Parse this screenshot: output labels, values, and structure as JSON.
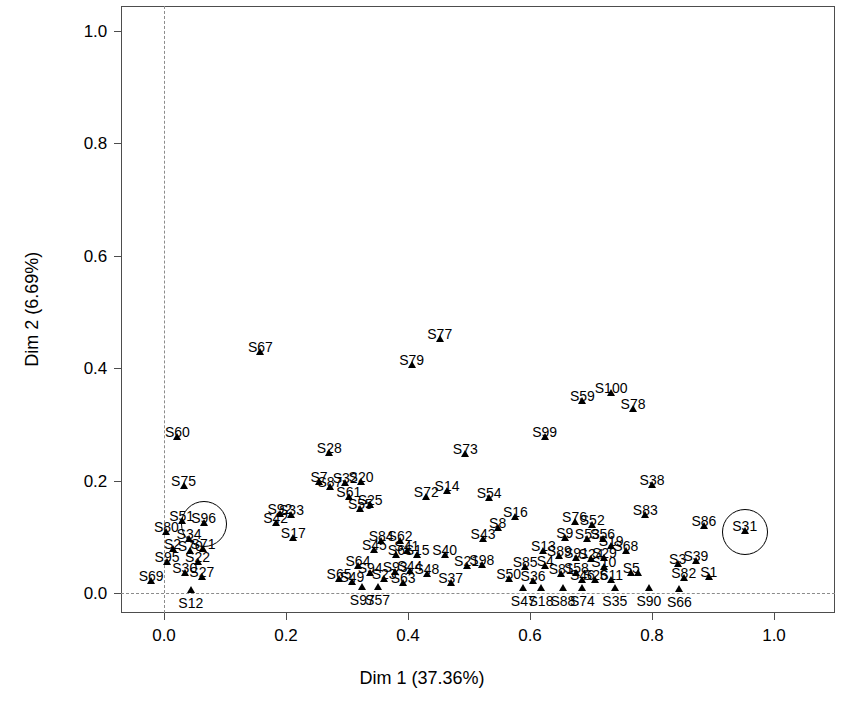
{
  "chart_data": {
    "type": "scatter",
    "title": "",
    "xlabel": "Dim 1 (37.36%)",
    "ylabel": "Dim 2 (6.69%)",
    "xlim": [
      -0.07,
      1.1
    ],
    "ylim": [
      -0.035,
      1.045
    ],
    "xticks": [
      "0.0",
      "0.2",
      "0.4",
      "0.6",
      "0.8",
      "1.0"
    ],
    "xtickvalues": [
      0.0,
      0.2,
      0.4,
      0.6,
      0.8,
      1.0
    ],
    "yticks": [
      "0.0",
      "0.2",
      "0.4",
      "0.6",
      "0.8",
      "1.0"
    ],
    "ytickvalues": [
      0.0,
      0.2,
      0.4,
      0.6,
      0.8,
      1.0
    ],
    "grid": false,
    "legend": "none",
    "marker": "filled-triangle",
    "marker_color": "#000000",
    "reference_lines": [
      {
        "orientation": "vertical",
        "value": 0.0,
        "style": "dashed",
        "color": "#8c8c8c"
      },
      {
        "orientation": "horizontal",
        "value": 0.0,
        "style": "dashed",
        "color": "#8c8c8c"
      }
    ],
    "highlighted": [
      "S96",
      "S31"
    ],
    "points": [
      {
        "label": "S67",
        "x": 0.158,
        "y": 0.423,
        "lx": -0.5,
        "ly": -15
      },
      {
        "label": "S77",
        "x": 0.452,
        "y": 0.447,
        "lx": -0.5,
        "ly": -15
      },
      {
        "label": "S79",
        "x": 0.406,
        "y": 0.4,
        "lx": -0.5,
        "ly": -15
      },
      {
        "label": "S100",
        "x": 0.733,
        "y": 0.351,
        "lx": -0.5,
        "ly": -15
      },
      {
        "label": "S59",
        "x": 0.686,
        "y": 0.336,
        "lx": -0.5,
        "ly": -15
      },
      {
        "label": "S78",
        "x": 0.769,
        "y": 0.322,
        "lx": -0.5,
        "ly": -15
      },
      {
        "label": "S60",
        "x": 0.022,
        "y": 0.272,
        "lx": -0.5,
        "ly": -15
      },
      {
        "label": "S99",
        "x": 0.624,
        "y": 0.272,
        "lx": -0.5,
        "ly": -15
      },
      {
        "label": "S28",
        "x": 0.271,
        "y": 0.243,
        "lx": -0.5,
        "ly": -15
      },
      {
        "label": "S73",
        "x": 0.494,
        "y": 0.242,
        "lx": -0.5,
        "ly": -15
      },
      {
        "label": "S75",
        "x": 0.032,
        "y": 0.185,
        "lx": -0.5,
        "ly": -15
      },
      {
        "label": "S7",
        "x": 0.254,
        "y": 0.192,
        "lx": -0.5,
        "ly": -15
      },
      {
        "label": "S87",
        "x": 0.272,
        "y": 0.183,
        "lx": -0.5,
        "ly": -15
      },
      {
        "label": "S32",
        "x": 0.297,
        "y": 0.191,
        "lx": -0.5,
        "ly": -15
      },
      {
        "label": "S20",
        "x": 0.323,
        "y": 0.192,
        "lx": -0.5,
        "ly": -15
      },
      {
        "label": "S38",
        "x": 0.8,
        "y": 0.186,
        "lx": -0.5,
        "ly": -15
      },
      {
        "label": "S61",
        "x": 0.303,
        "y": 0.166,
        "lx": -0.5,
        "ly": -15
      },
      {
        "label": "S72",
        "x": 0.43,
        "y": 0.166,
        "lx": -0.5,
        "ly": -15
      },
      {
        "label": "S14",
        "x": 0.464,
        "y": 0.176,
        "lx": -0.5,
        "ly": -15
      },
      {
        "label": "S54",
        "x": 0.533,
        "y": 0.163,
        "lx": -0.5,
        "ly": -15
      },
      {
        "label": "S25",
        "x": 0.338,
        "y": 0.152,
        "lx": -0.5,
        "ly": -15
      },
      {
        "label": "S55",
        "x": 0.322,
        "y": 0.145,
        "lx": -0.5,
        "ly": -15
      },
      {
        "label": "S92",
        "x": 0.19,
        "y": 0.135,
        "lx": -0.5,
        "ly": -15
      },
      {
        "label": "S33",
        "x": 0.209,
        "y": 0.133,
        "lx": -0.5,
        "ly": -15
      },
      {
        "label": "S83",
        "x": 0.789,
        "y": 0.134,
        "lx": -0.5,
        "ly": -15
      },
      {
        "label": "S96",
        "x": 0.065,
        "y": 0.119,
        "lx": -0.5,
        "ly": -15
      },
      {
        "label": "S42",
        "x": 0.183,
        "y": 0.119,
        "lx": -0.5,
        "ly": -15
      },
      {
        "label": "S51",
        "x": 0.029,
        "y": 0.122,
        "lx": -0.5,
        "ly": -15
      },
      {
        "label": "S16",
        "x": 0.576,
        "y": 0.13,
        "lx": -0.5,
        "ly": -15
      },
      {
        "label": "S76",
        "x": 0.673,
        "y": 0.121,
        "lx": -0.5,
        "ly": -15
      },
      {
        "label": "S52",
        "x": 0.702,
        "y": 0.116,
        "lx": -0.5,
        "ly": -15
      },
      {
        "label": "S80",
        "x": 0.004,
        "y": 0.104,
        "lx": -0.5,
        "ly": -15
      },
      {
        "label": "S8",
        "x": 0.547,
        "y": 0.11,
        "lx": -0.5,
        "ly": -15
      },
      {
        "label": "S86",
        "x": 0.885,
        "y": 0.113,
        "lx": -0.5,
        "ly": -15
      },
      {
        "label": "S31",
        "x": 0.952,
        "y": 0.105,
        "lx": -0.5,
        "ly": -15
      },
      {
        "label": "S17",
        "x": 0.212,
        "y": 0.092,
        "lx": -0.5,
        "ly": -15
      },
      {
        "label": "S34",
        "x": 0.041,
        "y": 0.09,
        "lx": -0.5,
        "ly": -15
      },
      {
        "label": "S9",
        "x": 0.657,
        "y": 0.093,
        "lx": -0.5,
        "ly": -15
      },
      {
        "label": "S53",
        "x": 0.694,
        "y": 0.091,
        "lx": -0.5,
        "ly": -15
      },
      {
        "label": "S56",
        "x": 0.719,
        "y": 0.09,
        "lx": -0.5,
        "ly": -15
      },
      {
        "label": "S2",
        "x": 0.014,
        "y": 0.073,
        "lx": -0.5,
        "ly": -15
      },
      {
        "label": "S70",
        "x": 0.043,
        "y": 0.069,
        "lx": -0.5,
        "ly": -15
      },
      {
        "label": "S71",
        "x": 0.064,
        "y": 0.073,
        "lx": -0.5,
        "ly": -15
      },
      {
        "label": "S84",
        "x": 0.356,
        "y": 0.087,
        "lx": -0.5,
        "ly": -15
      },
      {
        "label": "S62",
        "x": 0.387,
        "y": 0.088,
        "lx": -0.5,
        "ly": -15
      },
      {
        "label": "S45",
        "x": 0.345,
        "y": 0.072,
        "lx": -0.5,
        "ly": -15
      },
      {
        "label": "S41",
        "x": 0.398,
        "y": 0.07,
        "lx": -0.5,
        "ly": -15
      },
      {
        "label": "S6",
        "x": 0.381,
        "y": 0.063,
        "lx": -0.5,
        "ly": -15
      },
      {
        "label": "S15",
        "x": 0.415,
        "y": 0.062,
        "lx": -0.5,
        "ly": -15
      },
      {
        "label": "S43",
        "x": 0.523,
        "y": 0.09,
        "lx": -0.5,
        "ly": -15
      },
      {
        "label": "S40",
        "x": 0.46,
        "y": 0.062,
        "lx": -0.5,
        "ly": -15
      },
      {
        "label": "S13",
        "x": 0.622,
        "y": 0.069,
        "lx": -0.5,
        "ly": -15
      },
      {
        "label": "S89",
        "x": 0.648,
        "y": 0.06,
        "lx": -0.5,
        "ly": -15
      },
      {
        "label": "S91",
        "x": 0.676,
        "y": 0.057,
        "lx": -0.5,
        "ly": -15
      },
      {
        "label": "S24",
        "x": 0.7,
        "y": 0.056,
        "lx": -0.5,
        "ly": -15
      },
      {
        "label": "S29",
        "x": 0.722,
        "y": 0.057,
        "lx": -0.5,
        "ly": -15
      },
      {
        "label": "S19",
        "x": 0.733,
        "y": 0.079,
        "lx": -0.5,
        "ly": -15
      },
      {
        "label": "S68",
        "x": 0.757,
        "y": 0.07,
        "lx": -0.5,
        "ly": -15
      },
      {
        "label": "S95",
        "x": 0.005,
        "y": 0.049,
        "lx": -0.5,
        "ly": -15
      },
      {
        "label": "S22",
        "x": 0.055,
        "y": 0.049,
        "lx": -0.5,
        "ly": -15
      },
      {
        "label": "S30",
        "x": 0.034,
        "y": 0.031,
        "lx": -0.5,
        "ly": -15
      },
      {
        "label": "S27",
        "x": 0.062,
        "y": 0.023,
        "lx": -0.5,
        "ly": -15
      },
      {
        "label": "S21",
        "x": 0.496,
        "y": 0.043,
        "lx": -0.5,
        "ly": -15
      },
      {
        "label": "S98",
        "x": 0.521,
        "y": 0.045,
        "lx": -0.5,
        "ly": -15
      },
      {
        "label": "S85",
        "x": 0.592,
        "y": 0.041,
        "lx": -0.5,
        "ly": -15
      },
      {
        "label": "S4",
        "x": 0.625,
        "y": 0.042,
        "lx": -0.5,
        "ly": -15
      },
      {
        "label": "S10",
        "x": 0.721,
        "y": 0.041,
        "lx": -0.5,
        "ly": -15
      },
      {
        "label": "S3",
        "x": 0.842,
        "y": 0.046,
        "lx": -0.5,
        "ly": -15
      },
      {
        "label": "S39",
        "x": 0.872,
        "y": 0.052,
        "lx": -0.5,
        "ly": -15
      },
      {
        "label": "S44",
        "x": 0.403,
        "y": 0.034,
        "lx": -0.5,
        "ly": -15
      },
      {
        "label": "S93",
        "x": 0.379,
        "y": 0.032,
        "lx": -0.5,
        "ly": -15
      },
      {
        "label": "S94",
        "x": 0.338,
        "y": 0.031,
        "lx": -0.5,
        "ly": -15
      },
      {
        "label": "S64",
        "x": 0.318,
        "y": 0.043,
        "lx": -0.5,
        "ly": -15
      },
      {
        "label": "S48",
        "x": 0.431,
        "y": 0.029,
        "lx": -0.5,
        "ly": -15
      },
      {
        "label": "S81",
        "x": 0.651,
        "y": 0.028,
        "lx": -0.5,
        "ly": -15
      },
      {
        "label": "S58",
        "x": 0.676,
        "y": 0.031,
        "lx": -0.5,
        "ly": -15
      },
      {
        "label": "S46",
        "x": 0.686,
        "y": 0.017,
        "lx": -0.5,
        "ly": -15
      },
      {
        "label": "S26",
        "x": 0.707,
        "y": 0.018,
        "lx": -0.5,
        "ly": -15
      },
      {
        "label": "S11",
        "x": 0.733,
        "y": 0.018,
        "lx": -0.5,
        "ly": -15
      },
      {
        "label": "S5",
        "x": 0.766,
        "y": 0.03,
        "lx": -0.5,
        "ly": -15
      },
      {
        "label": "S57b",
        "x": 0.777,
        "y": 0.03,
        "lx": -0.5,
        "ly": -15
      },
      {
        "label": "S82",
        "x": 0.852,
        "y": 0.022,
        "lx": -0.5,
        "ly": -15
      },
      {
        "label": "S1",
        "x": 0.893,
        "y": 0.024,
        "lx": -0.5,
        "ly": -15
      },
      {
        "label": "S69",
        "x": -0.021,
        "y": 0.016,
        "lx": -0.5,
        "ly": -15
      },
      {
        "label": "S65",
        "x": 0.287,
        "y": 0.02,
        "lx": -0.5,
        "ly": -15
      },
      {
        "label": "S49",
        "x": 0.308,
        "y": 0.015,
        "lx": -0.5,
        "ly": -15
      },
      {
        "label": "S23",
        "x": 0.361,
        "y": 0.019,
        "lx": -0.5,
        "ly": -15
      },
      {
        "label": "S63",
        "x": 0.392,
        "y": 0.013,
        "lx": -0.5,
        "ly": -15
      },
      {
        "label": "S37",
        "x": 0.47,
        "y": 0.013,
        "lx": -0.5,
        "ly": -15
      },
      {
        "label": "S50",
        "x": 0.565,
        "y": 0.02,
        "lx": -0.5,
        "ly": -15
      },
      {
        "label": "S36",
        "x": 0.605,
        "y": 0.016,
        "lx": -0.5,
        "ly": -15
      },
      {
        "label": "S12",
        "x": 0.044,
        "y": 0.0,
        "lx": -0.5,
        "ly": 3
      },
      {
        "label": "S97",
        "x": 0.325,
        "y": 0.005,
        "lx": -0.5,
        "ly": 3
      },
      {
        "label": "S57",
        "x": 0.35,
        "y": 0.005,
        "lx": -0.5,
        "ly": 3
      },
      {
        "label": "S47",
        "x": 0.589,
        "y": 0.004,
        "lx": -0.5,
        "ly": 3
      },
      {
        "label": "S18",
        "x": 0.618,
        "y": 0.004,
        "lx": -0.5,
        "ly": 3
      },
      {
        "label": "S88",
        "x": 0.654,
        "y": 0.004,
        "lx": -0.5,
        "ly": 3
      },
      {
        "label": "S74",
        "x": 0.686,
        "y": 0.003,
        "lx": -0.5,
        "ly": 3
      },
      {
        "label": "S35",
        "x": 0.739,
        "y": 0.004,
        "lx": -0.5,
        "ly": 3
      },
      {
        "label": "S90",
        "x": 0.795,
        "y": 0.003,
        "lx": -0.5,
        "ly": 3
      },
      {
        "label": "S66",
        "x": 0.845,
        "y": 0.002,
        "lx": -0.5,
        "ly": 3
      }
    ]
  },
  "axes": {
    "x_title": "Dim 1 (37.36%)",
    "y_title": "Dim 2 (6.69%)"
  }
}
